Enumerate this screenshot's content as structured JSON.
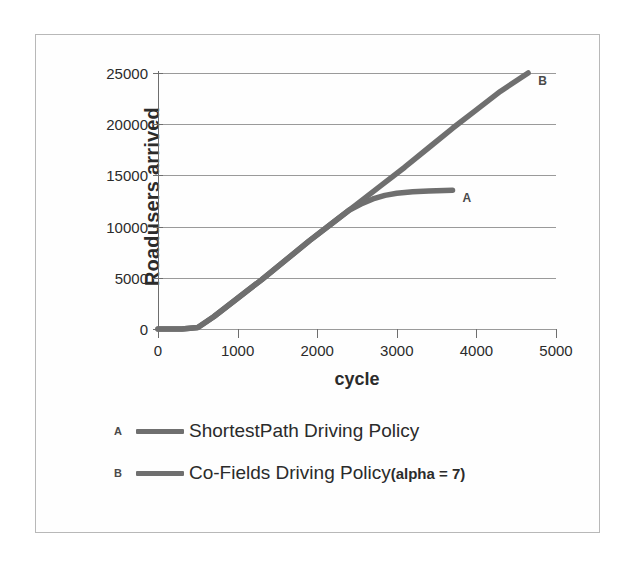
{
  "chart_data": {
    "type": "line",
    "title": "",
    "xlabel": "cycle",
    "ylabel": "Roadusers arrived",
    "xlim": [
      0,
      5000
    ],
    "ylim": [
      0,
      25000
    ],
    "xticks": [
      "0",
      "1000",
      "2000",
      "3000",
      "4000",
      "5000"
    ],
    "yticks": [
      "0",
      "5000",
      "10000",
      "15000",
      "20000",
      "25000"
    ],
    "grid": "horizontal",
    "legend_position": "below-plot",
    "line_color": "#6f6f6f",
    "grid_color": "#9a9a9a",
    "series": [
      {
        "key": "A",
        "name": "ShortestPath Driving Policy",
        "end_label": "A",
        "x": [
          0,
          300,
          500,
          700,
          1000,
          1300,
          1600,
          1900,
          2200,
          2400,
          2550,
          2700,
          2850,
          3000,
          3200,
          3400,
          3700
        ],
        "values": [
          0,
          0,
          150,
          1200,
          3000,
          4800,
          6700,
          8600,
          10400,
          11600,
          12200,
          12700,
          13050,
          13250,
          13400,
          13480,
          13550
        ]
      },
      {
        "key": "B",
        "name": "Co-Fields Driving Policy (alpha = 7)",
        "end_label": "B",
        "x": [
          0,
          300,
          500,
          700,
          1000,
          1300,
          1600,
          1900,
          2200,
          2500,
          2800,
          3100,
          3400,
          3700,
          4000,
          4300,
          4650
        ],
        "values": [
          0,
          0,
          150,
          1200,
          3000,
          4800,
          6700,
          8600,
          10400,
          12200,
          14000,
          15800,
          17700,
          19600,
          21400,
          23200,
          25000
        ]
      }
    ]
  },
  "legend": {
    "entries": [
      {
        "key": "A",
        "label": "ShortestPath Driving Policy",
        "suffix": ""
      },
      {
        "key": "B",
        "label": "Co-Fields Driving Policy ",
        "suffix": "(alpha = 7)"
      }
    ]
  }
}
